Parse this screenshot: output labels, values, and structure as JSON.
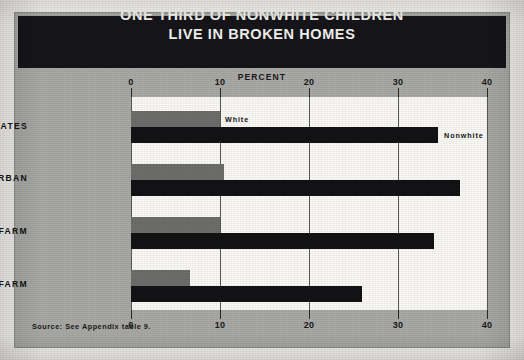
{
  "title": {
    "line1": "ONE THIRD OF NONWHITE CHILDREN",
    "line2": "LIVE IN BROKEN HOMES"
  },
  "axis_caption": "PERCENT",
  "source_note": "Source: See Appendix table 9.",
  "series_tags": {
    "white": "White",
    "nonwhite": "Nonwhite"
  },
  "colors": {
    "banner": "#16161a",
    "card": "#a9a9a6",
    "plot": "#fbfaf7",
    "white_bar": "#6e6e6c",
    "nonwhite_bar": "#131316"
  },
  "chart_data": {
    "type": "bar",
    "orientation": "horizontal",
    "title": "ONE THIRD OF NONWHITE CHILDREN LIVE IN BROKEN HOMES",
    "xlabel": "PERCENT",
    "ylabel": "",
    "xlim": [
      0,
      40
    ],
    "xticks": [
      0,
      10,
      20,
      30,
      40
    ],
    "xtick_labels": [
      "0",
      "10",
      "20",
      "30",
      "40"
    ],
    "grid": true,
    "grid_axis": "x",
    "legend_position": "inline-right-of-bars",
    "categories": [
      "UNITED STATES",
      "URBAN",
      "RURAL NONFARM",
      "RURAL FARM"
    ],
    "series": [
      {
        "name": "White",
        "values": [
          10.0,
          10.5,
          10.0,
          6.6
        ]
      },
      {
        "name": "Nonwhite",
        "values": [
          34.5,
          37.0,
          34.0,
          26.0
        ]
      }
    ]
  }
}
